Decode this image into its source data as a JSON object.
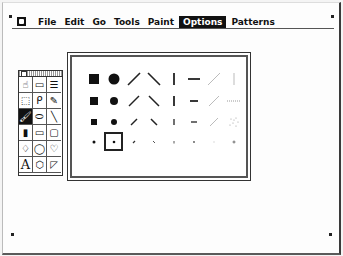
{
  "menubar": {
    "apple_icon": "apple-icon",
    "items": [
      {
        "label": "File",
        "active": false
      },
      {
        "label": "Edit",
        "active": false
      },
      {
        "label": "Go",
        "active": false
      },
      {
        "label": "Tools",
        "active": false
      },
      {
        "label": "Paint",
        "active": false
      },
      {
        "label": "Options",
        "active": true
      },
      {
        "label": "Patterns",
        "active": false
      }
    ]
  },
  "tools_palette": {
    "tools": [
      {
        "name": "browse-hand",
        "glyph": "☝"
      },
      {
        "name": "button",
        "glyph": "▭"
      },
      {
        "name": "field",
        "glyph": "☰"
      },
      {
        "name": "select",
        "glyph": "⬚"
      },
      {
        "name": "lasso",
        "glyph": "ᑭ"
      },
      {
        "name": "pencil",
        "glyph": "✎"
      },
      {
        "name": "brush",
        "glyph": "🖌",
        "selected": true
      },
      {
        "name": "eraser",
        "glyph": "⬭"
      },
      {
        "name": "line",
        "glyph": "╲"
      },
      {
        "name": "spray",
        "glyph": "▮"
      },
      {
        "name": "rectangle",
        "glyph": "▭"
      },
      {
        "name": "round-rect",
        "glyph": "▢"
      },
      {
        "name": "bucket",
        "glyph": "♢"
      },
      {
        "name": "oval",
        "glyph": "◯"
      },
      {
        "name": "curve",
        "glyph": "♡"
      },
      {
        "name": "text",
        "glyph": "A"
      },
      {
        "name": "regular-polygon",
        "glyph": "⬡"
      },
      {
        "name": "polygon",
        "glyph": "◸"
      }
    ]
  },
  "brushes_dialog": {
    "rows": 4,
    "cols": 8,
    "selected": {
      "row": 3,
      "col": 1
    },
    "brushes": [
      [
        "square-large",
        "circle-large",
        "slash-large",
        "backslash-large",
        "vbar-large",
        "hbar-large",
        "slash-thin-large",
        "vbar-thin-large"
      ],
      [
        "square-medium",
        "circle-medium",
        "slash-medium",
        "backslash-medium",
        "vbar-medium",
        "hbar-medium",
        "slash-thin-medium",
        "hdots-medium"
      ],
      [
        "square-small",
        "circle-small",
        "slash-small",
        "backslash-small",
        "vbar-small",
        "hbar-small",
        "slash-thin-small",
        "spray-dots"
      ],
      [
        "dot-1",
        "dot-2",
        "slash-tiny",
        "backslash-tiny",
        "vbar-tiny",
        "hbar-tiny",
        "dot-faint",
        "plus-tiny"
      ]
    ]
  }
}
